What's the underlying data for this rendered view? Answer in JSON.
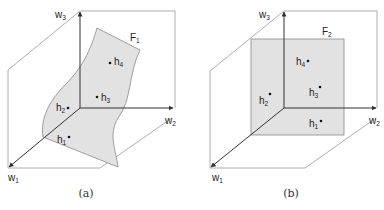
{
  "figure": {
    "panels": [
      {
        "id": "a",
        "caption": "(a)",
        "surface_label": "F",
        "surface_sub": "1",
        "surface_shape": "curved",
        "axes": [
          {
            "name": "w",
            "sub": "1"
          },
          {
            "name": "w",
            "sub": "2"
          },
          {
            "name": "w",
            "sub": "3"
          }
        ],
        "points": [
          {
            "name": "h",
            "sub": "1"
          },
          {
            "name": "h",
            "sub": "2"
          },
          {
            "name": "h",
            "sub": "3"
          },
          {
            "name": "h",
            "sub": "4"
          }
        ]
      },
      {
        "id": "b",
        "caption": "(b)",
        "surface_label": "F",
        "surface_sub": "2",
        "surface_shape": "planar",
        "axes": [
          {
            "name": "w",
            "sub": "1"
          },
          {
            "name": "w",
            "sub": "2"
          },
          {
            "name": "w",
            "sub": "3"
          }
        ],
        "points": [
          {
            "name": "h",
            "sub": "1"
          },
          {
            "name": "h",
            "sub": "2"
          },
          {
            "name": "h",
            "sub": "3"
          },
          {
            "name": "h",
            "sub": "4"
          }
        ]
      }
    ],
    "colors": {
      "surface_fill": "#e2e2e2",
      "surface_stroke": "#888888",
      "frame_stroke": "#999999",
      "axis_stroke": "#333333"
    }
  }
}
